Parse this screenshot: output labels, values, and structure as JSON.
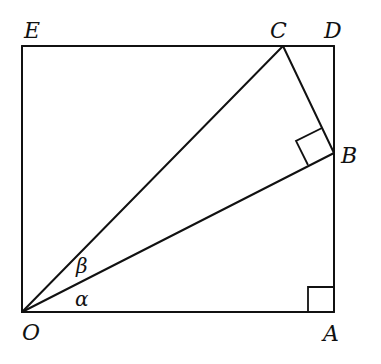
{
  "figure": {
    "type": "geometry-diagram",
    "points": {
      "O": {
        "label": "O",
        "x": 22,
        "y": 312
      },
      "A": {
        "label": "A",
        "x": 334,
        "y": 312
      },
      "B": {
        "label": "B",
        "x": 334,
        "y": 153
      },
      "C": {
        "label": "C",
        "x": 283,
        "y": 46
      },
      "D": {
        "label": "D",
        "x": 334,
        "y": 46
      },
      "E": {
        "label": "E",
        "x": 22,
        "y": 46
      }
    },
    "angles": {
      "alpha": {
        "label": "α",
        "between": "OA and OB"
      },
      "beta": {
        "label": "β",
        "between": "OB and OC"
      }
    },
    "right_angle_markers": [
      "A",
      "B"
    ],
    "segments": [
      "OA",
      "AD",
      "DE",
      "EO",
      "OB",
      "OC",
      "BC"
    ]
  }
}
